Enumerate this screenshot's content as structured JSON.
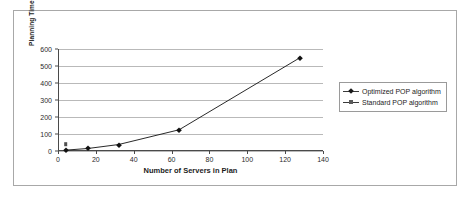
{
  "chart_data": {
    "type": "line",
    "title": "",
    "xlabel": "Number of Servers in Plan",
    "ylabel": "Planning Time (s)",
    "xlim": [
      0,
      140
    ],
    "ylim": [
      0,
      600
    ],
    "xticks": [
      0,
      20,
      40,
      60,
      80,
      100,
      120,
      140
    ],
    "yticks": [
      0,
      100,
      200,
      300,
      400,
      500,
      600
    ],
    "grid": "horizontal",
    "legend_position": "right",
    "series": [
      {
        "name": "Optimized POP algorithm",
        "marker": "diamond",
        "color": "#111111",
        "x": [
          4,
          16,
          32,
          64,
          128
        ],
        "values": [
          5,
          15,
          38,
          125,
          550
        ]
      },
      {
        "name": "Standard POP algorithm",
        "marker": "square",
        "color": "#4f4f4f",
        "x": [
          4
        ],
        "values": [
          40
        ]
      }
    ]
  },
  "legend": {
    "entries": [
      {
        "label": "Optimized POP algorithm"
      },
      {
        "label": "Standard POP algorithm"
      }
    ]
  },
  "axes": {
    "y_tick_labels": [
      "600",
      "500",
      "400",
      "300",
      "200",
      "100",
      "0"
    ],
    "x_tick_labels": [
      "0",
      "20",
      "40",
      "60",
      "80",
      "100",
      "120",
      "140"
    ]
  }
}
